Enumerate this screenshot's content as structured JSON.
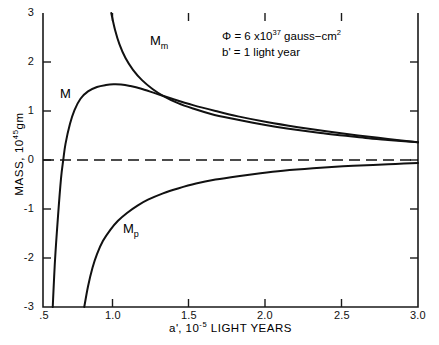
{
  "chart_data": {
    "type": "line",
    "title": "",
    "xlabel": "a', 10-5 LIGHT YEARS",
    "ylabel": "MASS, 1045 gm",
    "xlim": [
      0.5,
      3.0
    ],
    "ylim": [
      -3,
      3
    ],
    "grid": false,
    "legend_position": "inline-curve-labels",
    "xticks": [
      0.5,
      1.0,
      1.5,
      2.0,
      2.5,
      3.0
    ],
    "xtick_labels": [
      ".5",
      "1.0",
      "1.5",
      "2.0",
      "2.5",
      "3.0"
    ],
    "yticks": [
      3,
      2,
      1,
      0,
      -1,
      -2,
      -3
    ],
    "ytick_labels": [
      "3",
      "2",
      "1",
      "0",
      "-1",
      "-2",
      "-3"
    ],
    "zero_line": {
      "value": 0,
      "style": "dashed"
    },
    "series": [
      {
        "name": "Mm",
        "label": "M",
        "sublabel": "m",
        "points": [
          [
            0.955,
            3.0
          ],
          [
            0.98,
            2.66
          ],
          [
            1.01,
            2.36
          ],
          [
            1.05,
            2.08
          ],
          [
            1.1,
            1.84
          ],
          [
            1.16,
            1.63
          ],
          [
            1.23,
            1.45
          ],
          [
            1.3,
            1.31
          ],
          [
            1.4,
            1.16
          ],
          [
            1.5,
            1.05
          ],
          [
            1.62,
            0.94
          ],
          [
            1.75,
            0.85
          ],
          [
            1.9,
            0.76
          ],
          [
            2.05,
            0.68
          ],
          [
            2.2,
            0.61
          ],
          [
            2.35,
            0.55
          ],
          [
            2.5,
            0.5
          ],
          [
            2.65,
            0.45
          ],
          [
            2.8,
            0.41
          ],
          [
            3.0,
            0.36
          ]
        ]
      },
      {
        "name": "M",
        "label": "M",
        "sublabel": "",
        "points": [
          [
            0.565,
            -3.0
          ],
          [
            0.58,
            -2.05
          ],
          [
            0.6,
            -1.15
          ],
          [
            0.62,
            -0.38
          ],
          [
            0.635,
            0.0
          ],
          [
            0.65,
            0.33
          ],
          [
            0.68,
            0.74
          ],
          [
            0.71,
            1.02
          ],
          [
            0.75,
            1.25
          ],
          [
            0.8,
            1.4
          ],
          [
            0.86,
            1.49
          ],
          [
            0.92,
            1.53
          ],
          [
            0.97,
            1.545
          ],
          [
            1.02,
            1.54
          ],
          [
            1.08,
            1.51
          ],
          [
            1.15,
            1.46
          ],
          [
            1.25,
            1.36
          ],
          [
            1.35,
            1.26
          ],
          [
            1.5,
            1.12
          ],
          [
            1.65,
            1.0
          ],
          [
            1.8,
            0.89
          ],
          [
            2.0,
            0.77
          ],
          [
            2.2,
            0.67
          ],
          [
            2.4,
            0.58
          ],
          [
            2.6,
            0.5
          ],
          [
            2.8,
            0.43
          ],
          [
            3.0,
            0.36
          ]
        ]
      },
      {
        "name": "Mp",
        "label": "M",
        "sublabel": "p",
        "points": [
          [
            0.775,
            -3.0
          ],
          [
            0.8,
            -2.58
          ],
          [
            0.83,
            -2.2
          ],
          [
            0.86,
            -1.92
          ],
          [
            0.9,
            -1.65
          ],
          [
            0.95,
            -1.42
          ],
          [
            1.0,
            -1.24
          ],
          [
            1.06,
            -1.08
          ],
          [
            1.13,
            -0.93
          ],
          [
            1.2,
            -0.81
          ],
          [
            1.3,
            -0.68
          ],
          [
            1.4,
            -0.58
          ],
          [
            1.52,
            -0.48
          ],
          [
            1.65,
            -0.4
          ],
          [
            1.8,
            -0.33
          ],
          [
            1.95,
            -0.27
          ],
          [
            2.1,
            -0.22
          ],
          [
            2.3,
            -0.17
          ],
          [
            2.5,
            -0.13
          ],
          [
            2.7,
            -0.1
          ],
          [
            2.85,
            -0.08
          ],
          [
            3.0,
            -0.06
          ]
        ]
      }
    ]
  },
  "axis": {
    "y_title_prefix": "MASS, 10",
    "y_title_exp": "45",
    "y_title_suffix": "gm",
    "x_title_prefix": "a",
    "x_title_prime": "'",
    "x_title_mid": ", 10",
    "x_title_exp": "-5",
    "x_title_suffix": " LIGHT YEARS"
  },
  "annotation": {
    "line1_symbol": "Φ",
    "line1_eq": "=",
    "line1_coef": "6 x10",
    "line1_exp": "37",
    "line1_unit_a": "gauss−cm",
    "line1_unit_exp": "2",
    "line2_symbol": "b",
    "line2_prime": "'",
    "line2_eq": "=",
    "line2_value": "1  light  year"
  },
  "curve_labels": {
    "mm_main": "M",
    "mm_sub": "m",
    "m_main": "M",
    "mp_main": "M",
    "mp_sub": "p"
  },
  "colors": {
    "curve": "#111111",
    "axis": "#1a1a1a",
    "background": "#ffffff",
    "dashed_zero": "#111111"
  }
}
